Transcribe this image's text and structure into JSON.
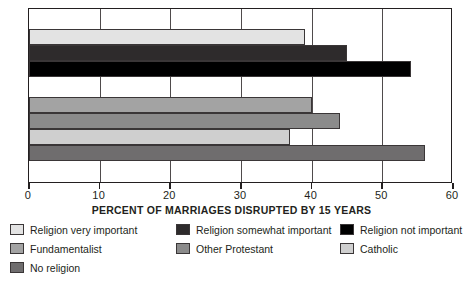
{
  "chart_data": {
    "type": "bar",
    "orientation": "horizontal",
    "title": "",
    "xlabel": "PERCENT OF MARRIAGES DISRUPTED BY 15 YEARS",
    "ylabel": "",
    "xlim": [
      0,
      60
    ],
    "xticks": [
      0,
      10,
      20,
      30,
      40,
      50,
      60
    ],
    "xtick_labels": [
      "0",
      "10",
      "20",
      "30",
      "40",
      "50",
      "60"
    ],
    "grid": true,
    "grid_axis": "x",
    "legend_position": "below",
    "categories": [
      "Religion very important",
      "Religion somewhat important",
      "Religion not important",
      "Fundamentalist",
      "Other Protestant",
      "Catholic",
      "No religion"
    ],
    "values": [
      39,
      45,
      54,
      40,
      44,
      37,
      56
    ],
    "colors": [
      "#e3e3e3",
      "#2e2b2c",
      "#000000",
      "#a3a3a3",
      "#8b8b8b",
      "#cfcfcf",
      "#6f6d6e"
    ],
    "groups": [
      {
        "name": "Religious importance",
        "categories": [
          "Religion very important",
          "Religion somewhat important",
          "Religion not important"
        ],
        "values": [
          39,
          45,
          54
        ]
      },
      {
        "name": "Religious affiliation",
        "categories": [
          "Fundamentalist",
          "Other Protestant",
          "Catholic",
          "No religion"
        ],
        "values": [
          40,
          44,
          37,
          56
        ]
      }
    ]
  },
  "axis": {
    "title": "PERCENT OF MARRIAGES DISRUPTED BY 15 YEARS",
    "tick_labels": [
      "0",
      "10",
      "20",
      "30",
      "40",
      "50",
      "60"
    ]
  },
  "legend": {
    "columns": [
      [
        {
          "label": "Religion very important",
          "color": "#e3e3e3"
        },
        {
          "label": "Fundamentalist",
          "color": "#a3a3a3"
        },
        {
          "label": "No religion",
          "color": "#6f6d6e"
        }
      ],
      [
        {
          "label": "Religion somewhat important",
          "color": "#2e2b2c"
        },
        {
          "label": "Other Protestant",
          "color": "#8b8b8b"
        }
      ],
      [
        {
          "label": "Religion not important",
          "color": "#000000"
        },
        {
          "label": "Catholic",
          "color": "#cfcfcf"
        }
      ]
    ]
  }
}
